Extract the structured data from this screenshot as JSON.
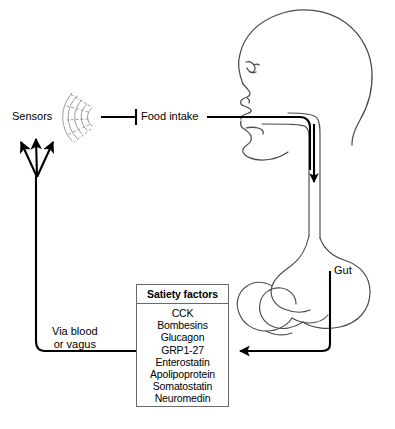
{
  "diagram": {
    "labels": {
      "sensors": "Sensors",
      "food_intake": "Food intake",
      "gut": "Gut",
      "via_blood_line1": "Via blood",
      "via_blood_line2": "or vagus"
    },
    "satiety_box": {
      "title": "Satiety factors",
      "items": [
        "CCK",
        "Bombesins",
        "Glucagon",
        "GRP1-27",
        "Enterostatin",
        "Apolipoprotein",
        "Somatostatin",
        "Neuromedin"
      ]
    },
    "colors": {
      "stroke": "#000000",
      "anatomy_stroke": "#4c4c4c",
      "box_border": "#6a6a6a",
      "background": "#ffffff",
      "sensor_waves": "#8a8a8a"
    },
    "connectors": [
      {
        "name": "food-intake-to-sensors",
        "from": "Food intake",
        "to": "Sensors",
        "ending": "inhibition-tbar"
      },
      {
        "name": "food-intake-to-mouth",
        "from": "Food intake",
        "to": "mouth",
        "ending": "line"
      },
      {
        "name": "esophagus-flow-arrow",
        "from": "mouth",
        "to": "stomach",
        "ending": "arrow-down"
      },
      {
        "name": "gut-to-satiety-factors",
        "from": "Gut",
        "to": "Satiety factors",
        "ending": "arrow-left"
      },
      {
        "name": "satiety-factors-to-sensors",
        "from": "Satiety factors",
        "to": "Sensors",
        "ending": "three-arrows-up"
      }
    ]
  }
}
